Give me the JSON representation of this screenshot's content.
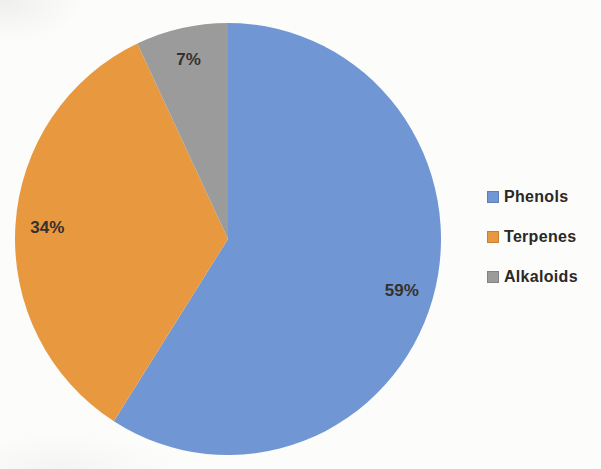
{
  "chart_data": {
    "type": "pie",
    "title": "",
    "categories": [
      "Phenols",
      "Terpenes",
      "Alkaloids"
    ],
    "values": [
      59,
      34,
      7
    ],
    "labels": [
      "59%",
      "34%",
      "7%"
    ],
    "colors": [
      "#7097d3",
      "#e8983f",
      "#9b9b9b"
    ],
    "unit": "%",
    "start_angle_deg": 0,
    "direction": "clockwise",
    "legend": {
      "position": "right",
      "entries": [
        "Phenols",
        "Terpenes",
        "Alkaloids"
      ]
    },
    "label_color": "#35312d",
    "background": "#fcfcfb",
    "geometry": {
      "cx": 228,
      "cy": 239,
      "rx": 213,
      "ry": 216,
      "label_radius_factor": 0.85
    }
  }
}
